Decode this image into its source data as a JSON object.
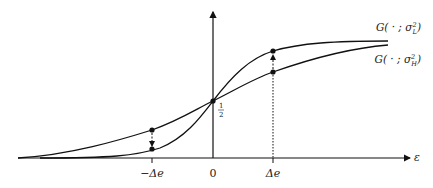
{
  "figure": {
    "curves": [
      {
        "name": "G_sigma_L",
        "label": "G( · ; σ²_L)",
        "label_main": "G( · ; σ",
        "label_sup": "2",
        "label_sub": "L",
        "label_close": ")"
      },
      {
        "name": "G_sigma_H",
        "label": "G( · ; σ²_H)",
        "label_main": "G( · ; σ",
        "label_sup": "2",
        "label_sub": "H",
        "label_close": ")"
      }
    ],
    "x_axis_label": "ε",
    "x_ticks": [
      {
        "label": "−Δe",
        "value": "-Δe"
      },
      {
        "label": "0",
        "value": "0"
      },
      {
        "label": "Δe",
        "value": "Δe"
      }
    ],
    "half_label_num": "1",
    "half_label_den": "2"
  },
  "chart_data": {
    "type": "line",
    "title": "",
    "xlabel": "ε",
    "ylabel": "",
    "series": [
      {
        "name": "G( · ; σ²_L)",
        "description": "steeper CDF (low variance)",
        "points": {
          "-Δe": 0.12,
          "0": 0.5,
          "Δe": 0.88
        }
      },
      {
        "name": "G( · ; σ²_H)",
        "description": "flatter CDF (high variance)",
        "points": {
          "-Δe": 0.24,
          "0": 0.5,
          "Δe": 0.76
        }
      }
    ],
    "annotations": [
      "1/2 at ε = 0",
      "arrow down at −Δe from σ²_H to σ²_L",
      "arrow up at Δe from σ²_H to σ²_L"
    ],
    "grid": false
  }
}
